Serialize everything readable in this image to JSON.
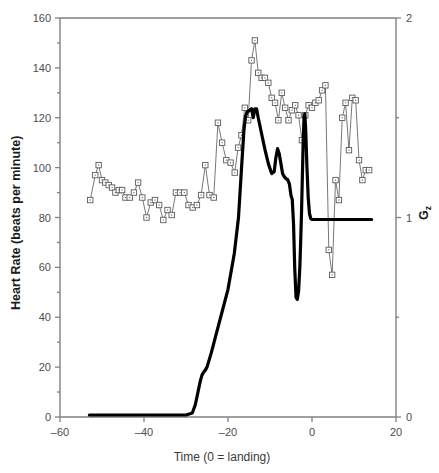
{
  "chart_data": {
    "type": "line",
    "title": "",
    "xlabel": "Time (0 = landing)",
    "ylabel": "Heart Rate (beats per minute)",
    "y2label": "Gz",
    "xlim": [
      -60,
      20
    ],
    "ylim": [
      0,
      160
    ],
    "y2lim": [
      0,
      2
    ],
    "xticks": [
      -60,
      -40,
      -20,
      0,
      20
    ],
    "xtick_labels": [
      "–60",
      "–40",
      "–20",
      "0",
      "20"
    ],
    "yticks": [
      0,
      20,
      40,
      60,
      80,
      100,
      120,
      140,
      160
    ],
    "ytick_labels": [
      "0",
      "20",
      "40",
      "60",
      "80",
      "100",
      "120",
      "140",
      "160"
    ],
    "yminorticks": [
      10,
      30,
      50,
      70,
      90,
      110,
      130,
      150
    ],
    "y2ticks": [
      0,
      1,
      2
    ],
    "y2tick_labels": [
      "0",
      "1",
      "2"
    ],
    "y2minorticks": [
      0.5,
      1.5
    ],
    "grid": false,
    "legend": "none",
    "series": [
      {
        "name": "Heart Rate",
        "axis": "left",
        "marker": "open-square",
        "color": "#555555",
        "x": [
          -52.8,
          -51.6,
          -50.8,
          -50.0,
          -49.2,
          -48.4,
          -47.6,
          -46.8,
          -46.0,
          -45.2,
          -44.4,
          -43.4,
          -42.4,
          -41.4,
          -40.4,
          -39.4,
          -38.4,
          -37.4,
          -36.4,
          -35.4,
          -34.4,
          -33.4,
          -32.4,
          -31.4,
          -30.4,
          -29.4,
          -28.4,
          -27.4,
          -26.4,
          -25.4,
          -24.4,
          -23.4,
          -22.4,
          -21.4,
          -20.4,
          -19.4,
          -18.4,
          -17.6,
          -16.8,
          -16.0,
          -15.2,
          -14.4,
          -13.6,
          -12.8,
          -12.0,
          -11.2,
          -10.4,
          -9.6,
          -8.8,
          -8.0,
          -7.2,
          -6.4,
          -5.6,
          -4.8,
          -4.0,
          -3.2,
          -2.4,
          -1.6,
          -0.8,
          0.0,
          0.8,
          1.6,
          2.4,
          3.2,
          4.0,
          4.8,
          5.6,
          6.4,
          7.2,
          8.0,
          8.8,
          9.6,
          10.4,
          11.2,
          12.0,
          12.8,
          13.6
        ],
        "y": [
          87,
          97,
          101,
          95,
          94,
          93,
          92,
          90,
          91,
          91,
          88,
          88,
          90,
          94,
          88,
          80,
          86,
          87,
          85,
          79,
          83,
          81,
          90,
          90,
          90,
          85,
          84,
          85,
          89,
          101,
          89,
          88,
          118,
          110,
          103,
          102,
          98,
          108,
          113,
          124,
          119,
          143,
          151,
          138,
          136,
          136,
          134,
          128,
          126,
          119,
          130,
          124,
          119,
          123,
          125,
          121,
          111,
          121,
          125,
          124,
          126,
          127,
          131,
          133,
          67,
          57,
          95,
          87,
          120,
          126,
          107,
          128,
          127,
          103,
          95,
          99,
          99
        ]
      },
      {
        "name": "Gz",
        "axis": "right",
        "marker": "none",
        "color": "#000000",
        "linewidth": 3.2,
        "x": [
          -53.0,
          -45.0,
          -35.0,
          -30.0,
          -28.5,
          -27.8,
          -27.2,
          -26.6,
          -26.2,
          -25.8,
          -25.4,
          -25.0,
          -24.0,
          -23.0,
          -21.5,
          -20.0,
          -18.5,
          -17.5,
          -16.8,
          -16.2,
          -15.8,
          -15.4,
          -15.0,
          -14.4,
          -14.0,
          -13.6,
          -13.2,
          -12.8,
          -12.0,
          -11.2,
          -10.4,
          -9.6,
          -9.0,
          -8.6,
          -8.2,
          -7.8,
          -7.4,
          -7.0,
          -6.6,
          -6.2,
          -5.8,
          -5.4,
          -5.0,
          -4.7,
          -4.4,
          -4.1,
          -3.8,
          -3.5,
          -3.2,
          -2.9,
          -2.7,
          -2.5,
          -2.3,
          -2.1,
          -1.9,
          -1.7,
          -1.5,
          -1.2,
          -0.9,
          -0.6,
          -0.3,
          0.0,
          0.5,
          1.5,
          4.0,
          8.0,
          12.0,
          14.2
        ],
        "y": [
          0.01,
          0.01,
          0.01,
          0.01,
          0.02,
          0.06,
          0.12,
          0.18,
          0.21,
          0.225,
          0.235,
          0.25,
          0.32,
          0.4,
          0.52,
          0.64,
          0.82,
          1.0,
          1.24,
          1.44,
          1.51,
          1.53,
          1.535,
          1.545,
          1.5,
          1.545,
          1.545,
          1.5,
          1.42,
          1.34,
          1.27,
          1.22,
          1.23,
          1.3,
          1.345,
          1.32,
          1.27,
          1.22,
          1.205,
          1.195,
          1.19,
          1.17,
          1.11,
          1.09,
          0.97,
          0.74,
          0.6,
          0.59,
          0.63,
          0.75,
          0.88,
          1.02,
          1.2,
          1.38,
          1.5,
          1.52,
          1.44,
          1.25,
          1.1,
          1.02,
          0.995,
          0.99,
          0.99,
          0.99,
          0.99,
          0.99,
          0.99,
          0.99
        ]
      }
    ]
  },
  "axes": {
    "frame_color": "#808080",
    "marker_edge": "#5a5a5a"
  }
}
